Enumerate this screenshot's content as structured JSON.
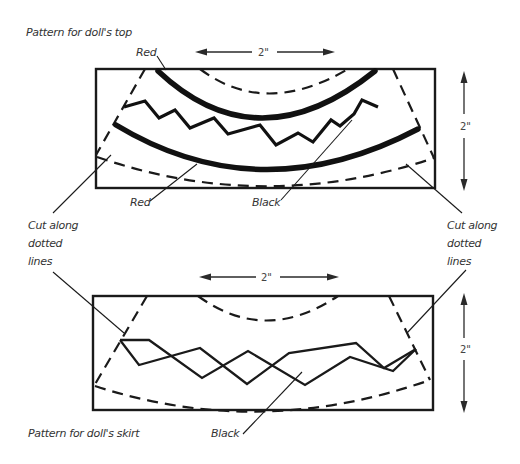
{
  "figure": {
    "top_pattern": {
      "title": "Pattern for doll's top",
      "width_label": "2\"",
      "height_label": "2\"",
      "labels": {
        "red_upper": "Red",
        "red_lower": "Red",
        "black": "Black",
        "cut_left": [
          "Cut along",
          "dotted",
          "lines"
        ],
        "cut_right": [
          "Cut along",
          "dotted",
          "lines"
        ]
      }
    },
    "bottom_pattern": {
      "title": "Pattern for doll's skirt",
      "width_label": "2\"",
      "height_label": "2\"",
      "labels": {
        "black": "Black"
      }
    },
    "colors": {
      "line": "#1a1a1a",
      "background": "#ffffff",
      "text": "#333333"
    }
  }
}
